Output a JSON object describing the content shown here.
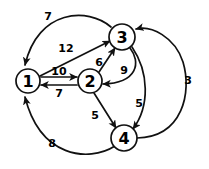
{
  "graph": {
    "title": "Directed Weighted Graph",
    "background_color": "#ffffff",
    "stroke_color": "#111111",
    "text_color": "#000000",
    "nodes": [
      {
        "id": "1",
        "label": "1",
        "cx": 28,
        "cy": 81,
        "r": 12
      },
      {
        "id": "2",
        "label": "2",
        "cx": 90,
        "cy": 81,
        "r": 12
      },
      {
        "id": "3",
        "label": "3",
        "cx": 122,
        "cy": 37,
        "r": 13
      },
      {
        "id": "4",
        "label": "4",
        "cx": 124,
        "cy": 138,
        "r": 13
      }
    ],
    "edges": [
      {
        "id": "e-3-1",
        "from": "3",
        "to": "1",
        "weight": "7",
        "label_x": 48,
        "label_y": 16,
        "path": "M 111 27 C 88 7, 38 9, 25 65",
        "directed": true
      },
      {
        "id": "e-1-3",
        "from": "1",
        "to": "3",
        "weight": "12",
        "label_x": 66,
        "label_y": 48,
        "path": "M 40 76 L 110 41",
        "directed": true
      },
      {
        "id": "e-1-2",
        "from": "1",
        "to": "2",
        "weight": "10",
        "label_x": 59,
        "label_y": 71,
        "path": "M 41 77 L 77 77",
        "directed": true
      },
      {
        "id": "e-2-1",
        "from": "2",
        "to": "1",
        "weight": "7",
        "label_x": 59,
        "label_y": 93,
        "path": "M 77 85 L 41 85",
        "directed": true
      },
      {
        "id": "e-2-3",
        "from": "2",
        "to": "3",
        "weight": "6",
        "label_x": 99,
        "label_y": 62,
        "path": "M 99 72 L 115 48",
        "directed": true
      },
      {
        "id": "e-3-2",
        "from": "3",
        "to": "2",
        "weight": "9",
        "label_x": 124,
        "label_y": 70,
        "path": "M 130 48 C 141 62, 138 83, 103 84",
        "directed": true
      },
      {
        "id": "e-2-4",
        "from": "2",
        "to": "4",
        "weight": "5",
        "label_x": 95,
        "label_y": 115,
        "path": "M 94 93 L 116 128",
        "directed": true
      },
      {
        "id": "e-3-4",
        "from": "3",
        "to": "4",
        "weight": "5",
        "label_x": 139,
        "label_y": 103,
        "path": "M 132 47 C 149 72, 150 106, 133 129",
        "directed": true
      },
      {
        "id": "e-4-3",
        "from": "4",
        "to": "3",
        "weight": "3",
        "label_x": 188,
        "label_y": 80,
        "path": "M 137 138 C 183 137, 192 92, 183 62 C 175 37, 151 25, 136 29",
        "directed": true
      },
      {
        "id": "e-4-1",
        "from": "4",
        "to": "1",
        "weight": "8",
        "label_x": 52,
        "label_y": 143,
        "path": "M 115 146 C 88 163, 40 157, 25 97",
        "directed": true
      }
    ]
  }
}
